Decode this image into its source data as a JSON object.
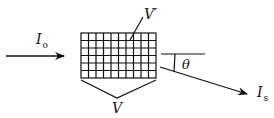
{
  "diagram": {
    "type": "scattering-schematic",
    "stroke_color": "#111111",
    "background": "#ffffff",
    "incident_beam": {
      "label_main": "I",
      "label_sub": "o",
      "direction": "left-to-right"
    },
    "sample_grid": {
      "columns": 10,
      "rows": 6,
      "subvolume_label": "V′",
      "total_volume_label": "V"
    },
    "reference_line": {
      "orientation": "horizontal"
    },
    "angle": {
      "label": "θ"
    },
    "scattered_beam": {
      "label_main": "I",
      "label_sub": "s",
      "direction": "down-right"
    }
  }
}
